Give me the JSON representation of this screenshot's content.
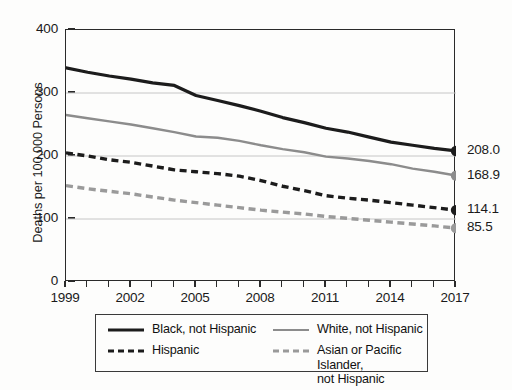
{
  "chart_data": {
    "type": "line",
    "title": "",
    "subtitle": "",
    "xlabel": "",
    "ylabel": "Deaths per 100,000 Persons",
    "xlim": [
      1999,
      2017
    ],
    "ylim": [
      0,
      400
    ],
    "y_ticks": [
      0,
      100,
      200,
      300,
      400
    ],
    "y_tick_labels": [
      "0",
      "100",
      "200",
      "300",
      "400"
    ],
    "x_ticks": [
      1999,
      2000,
      2001,
      2002,
      2003,
      2004,
      2005,
      2006,
      2007,
      2008,
      2009,
      2010,
      2011,
      2012,
      2013,
      2014,
      2015,
      2016,
      2017
    ],
    "x_tick_labels_shown": [
      "1999",
      "2002",
      "2005",
      "2008",
      "2011",
      "2014",
      "2017"
    ],
    "x": [
      1999,
      2000,
      2001,
      2002,
      2003,
      2004,
      2005,
      2006,
      2007,
      2008,
      2009,
      2010,
      2011,
      2012,
      2013,
      2014,
      2015,
      2016,
      2017
    ],
    "grid": "horizontal",
    "legend_position": "bottom",
    "series": [
      {
        "name": "Black, not Hispanic",
        "color": "#1c1c1c",
        "style": "solid",
        "end_label": "208.0",
        "end_value": 208.0,
        "values": [
          340.0,
          333.0,
          327.0,
          322.0,
          316.0,
          312.0,
          296.0,
          288.0,
          280.0,
          271.0,
          261.0,
          253.0,
          244.0,
          238.0,
          230.0,
          222.0,
          217.0,
          212.0,
          208.0
        ]
      },
      {
        "name": "White, not Hispanic",
        "color": "#8c8c8c",
        "style": "solid",
        "end_label": "168.9",
        "end_value": 168.9,
        "values": [
          265.0,
          260.0,
          255.0,
          250.0,
          244.0,
          238.0,
          231.0,
          229.0,
          224.0,
          217.0,
          211.0,
          206.0,
          199.0,
          196.0,
          192.0,
          187.0,
          180.0,
          175.0,
          168.9
        ]
      },
      {
        "name": "Hispanic",
        "color": "#1c1c1c",
        "style": "dashed",
        "end_label": "114.1",
        "end_value": 114.1,
        "values": [
          205.0,
          200.0,
          194.0,
          190.0,
          184.0,
          178.0,
          175.0,
          172.0,
          168.0,
          161.0,
          152.0,
          145.0,
          137.0,
          133.0,
          130.0,
          126.0,
          122.0,
          118.0,
          114.1
        ]
      },
      {
        "name": "Asian or Pacific Islander, not Hispanic",
        "color": "#9a9a9a",
        "style": "dashed",
        "end_label": "85.5",
        "end_value": 85.5,
        "values": [
          153.0,
          148.0,
          144.0,
          140.0,
          135.0,
          130.0,
          126.0,
          122.0,
          118.0,
          114.0,
          111.0,
          108.0,
          104.0,
          101.0,
          98.0,
          95.0,
          92.0,
          89.0,
          85.5
        ]
      }
    ]
  },
  "axes": {
    "y_title": "Deaths per 100,000 Persons",
    "y_labels": [
      "400",
      "300",
      "200",
      "100",
      "0"
    ],
    "x_labels": [
      "1999",
      "2002",
      "2005",
      "2008",
      "2011",
      "2014",
      "2017"
    ]
  },
  "end_labels": [
    "208.0",
    "168.9",
    "114.1",
    "85.5"
  ],
  "legend": {
    "entries": [
      {
        "label": "Black, not Hispanic",
        "style": "solid",
        "color": "#1c1c1c"
      },
      {
        "label": "Hispanic",
        "style": "dashed",
        "color": "#1c1c1c"
      },
      {
        "label": "White, not Hispanic",
        "style": "solid",
        "color": "#8c8c8c"
      },
      {
        "label": "Asian or Pacific Islander,\nnot Hispanic",
        "style": "dashed",
        "color": "#9a9a9a"
      }
    ]
  },
  "colors": {
    "black_series": "#1c1c1c",
    "gray_series": "#8c8c8c",
    "gray_dashed_series": "#9a9a9a",
    "axis": "#2a2a2a",
    "gridline": "#c6c6c6",
    "background": "#fdfdfc"
  }
}
